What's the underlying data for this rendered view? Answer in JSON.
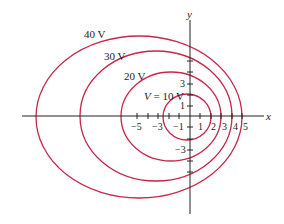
{
  "diagram": {
    "curve_color": "#c8264a",
    "axis_color": "#222222",
    "axes": {
      "x_label": "x",
      "y_label": "y"
    },
    "x_ticks": [
      {
        "value": -5,
        "label": "−5"
      },
      {
        "value": -3,
        "label": "−3"
      },
      {
        "value": -1,
        "label": "−1"
      },
      {
        "value": 1,
        "label": "1"
      },
      {
        "value": 2,
        "label": "2"
      },
      {
        "value": 3,
        "label": "3"
      },
      {
        "value": 4,
        "label": "4"
      },
      {
        "value": 5,
        "label": "5"
      }
    ],
    "y_ticks": [
      {
        "value": 3,
        "label": "3"
      },
      {
        "value": 1,
        "label": "1"
      },
      {
        "value": -3,
        "label": "−3"
      }
    ],
    "curves": [
      {
        "label": "V = 10 V",
        "prefix": "V",
        "suffix": " = 10 V"
      },
      {
        "label": "20 V"
      },
      {
        "label": "30 V"
      },
      {
        "label": "40 V"
      }
    ]
  }
}
